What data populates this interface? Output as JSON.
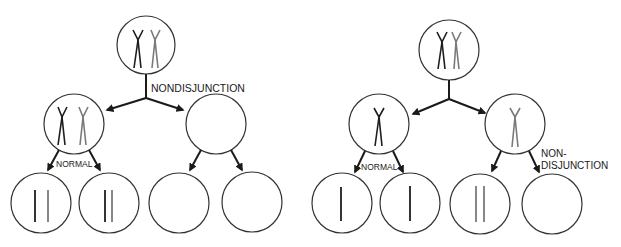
{
  "colors": {
    "background": "#ffffff",
    "outline": "#333333",
    "arrow": "#1a1a1a",
    "chromosome_dark": "#1e1e1e",
    "chromosome_gray": "#7a7a7a"
  },
  "panels": [
    {
      "id": "meiosis-I-nondisjunction",
      "labels": {
        "nondisjunction": "NONDISJUNCTION",
        "normal": "NORMAL"
      }
    },
    {
      "id": "meiosis-II-nondisjunction",
      "labels": {
        "normal": "NORMAL",
        "nondisjunction_line1": "NON-",
        "nondisjunction_line2": "DISJUNCTION"
      }
    }
  ]
}
